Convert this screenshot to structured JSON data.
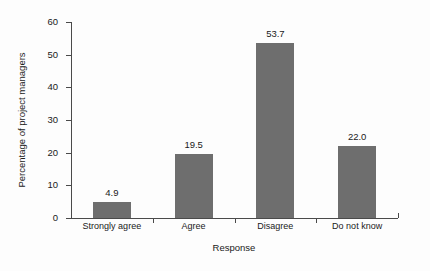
{
  "chart_data": {
    "type": "bar",
    "title": "",
    "subtitle": "",
    "categories": [
      "Strongly agree",
      "Agree",
      "Disagree",
      "Do not know"
    ],
    "values": [
      4.9,
      19.5,
      53.7,
      22.0
    ],
    "data_labels": [
      "4.9",
      "19.5",
      "53.7",
      "22.0"
    ],
    "xlabel": "Response",
    "ylabel": "Percentage of project managers",
    "ylim": [
      0,
      60
    ],
    "ytick_labels": [
      "0",
      "10",
      "20",
      "30",
      "40",
      "50",
      "60"
    ],
    "ytick_values": [
      0,
      10,
      20,
      30,
      40,
      50,
      60
    ],
    "grid": false,
    "legend": null,
    "bar_color": "#6e6e6e",
    "axis_color": "#4a4a4a",
    "background_color": "#fdfdfd",
    "text_color": "#1a1a1a"
  }
}
